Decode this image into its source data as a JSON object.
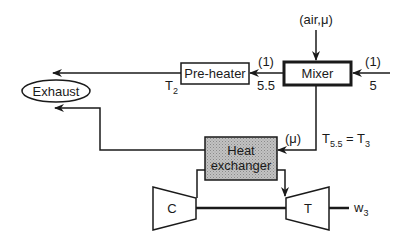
{
  "diagram": {
    "type": "process-flow",
    "components": {
      "mixer": {
        "label": "Mixer"
      },
      "preheater": {
        "label": "Pre-heater"
      },
      "heat_exchanger": {
        "label_line1": "Heat",
        "label_line2": "exchanger"
      },
      "exhaust": {
        "label": "Exhaust"
      },
      "compressor": {
        "label": "C"
      },
      "turbine": {
        "label": "T"
      }
    },
    "streams": {
      "air_inlet": "(air,μ)",
      "inlet_flow": "(1)",
      "inlet_state": "5",
      "mixer_out_flow": "(1)",
      "mixer_out_state": "5.5",
      "preheater_out_T": "T",
      "preheater_out_T_sub": "2",
      "hx_in_flow": "(μ)",
      "temp_eq_T1": "T",
      "temp_eq_T1_sub": "5.5",
      "temp_eq_sign": " = ",
      "temp_eq_T2": "T",
      "temp_eq_T2_sub": "3",
      "work_out": "w",
      "work_out_sub": "3"
    },
    "colors": {
      "line": "#1a1a1a",
      "hx_fill": "#b4b4b4"
    }
  }
}
